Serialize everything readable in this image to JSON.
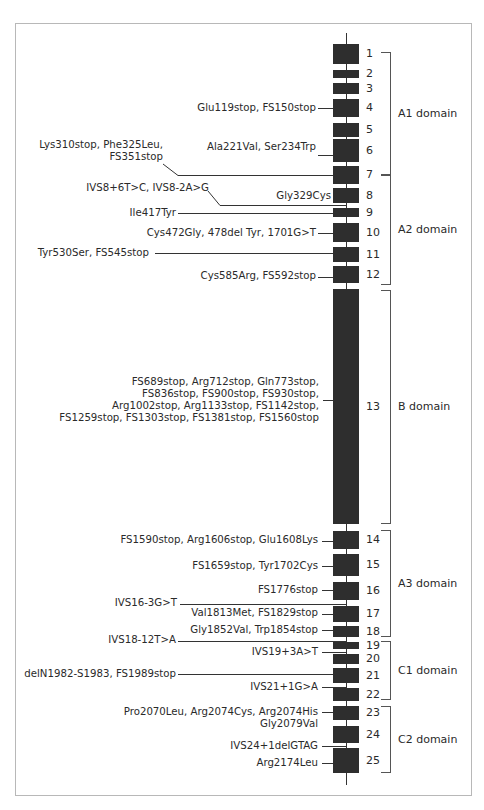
{
  "figure": {
    "title": "",
    "axis_line": {
      "x": 346,
      "y_start": 33,
      "y_end": 785
    }
  },
  "exons": [
    {
      "n": "1",
      "top": 44,
      "bottom": 64
    },
    {
      "n": "2",
      "top": 70,
      "bottom": 78
    },
    {
      "n": "3",
      "top": 83,
      "bottom": 94
    },
    {
      "n": "4",
      "top": 99,
      "bottom": 117
    },
    {
      "n": "5",
      "top": 123,
      "bottom": 137
    },
    {
      "n": "6",
      "top": 139,
      "bottom": 162
    },
    {
      "n": "7",
      "top": 166,
      "bottom": 184
    },
    {
      "n": "8",
      "top": 188,
      "bottom": 203
    },
    {
      "n": "9",
      "top": 208,
      "bottom": 217
    },
    {
      "n": "10",
      "top": 223,
      "bottom": 242
    },
    {
      "n": "11",
      "top": 247,
      "bottom": 262
    },
    {
      "n": "12",
      "top": 266,
      "bottom": 283
    },
    {
      "n": "13",
      "top": 289,
      "bottom": 524
    },
    {
      "n": "14",
      "top": 531,
      "bottom": 549
    },
    {
      "n": "15",
      "top": 554,
      "bottom": 576
    },
    {
      "n": "16",
      "top": 582,
      "bottom": 600
    },
    {
      "n": "17",
      "top": 606,
      "bottom": 622
    },
    {
      "n": "18",
      "top": 626,
      "bottom": 637
    },
    {
      "n": "19",
      "top": 642,
      "bottom": 649
    },
    {
      "n": "20",
      "top": 654,
      "bottom": 664
    },
    {
      "n": "21",
      "top": 668,
      "bottom": 683
    },
    {
      "n": "22",
      "top": 688,
      "bottom": 701
    },
    {
      "n": "23",
      "top": 706,
      "bottom": 720
    },
    {
      "n": "24",
      "top": 726,
      "bottom": 743
    },
    {
      "n": "25",
      "top": 748,
      "bottom": 773
    }
  ],
  "domains": [
    {
      "name": "A1 domain",
      "top": 52,
      "bottom": 175
    },
    {
      "name": "A2 domain",
      "top": 175,
      "bottom": 285
    },
    {
      "name": "B domain",
      "top": 290,
      "bottom": 524
    },
    {
      "name": "A3 domain",
      "top": 530,
      "bottom": 637
    },
    {
      "name": "C1 domain",
      "top": 641,
      "bottom": 700
    },
    {
      "name": "C2 domain",
      "top": 706,
      "bottom": 773
    }
  ],
  "mutations": [
    {
      "lines": [
        "Glu119stop, FS150stop"
      ],
      "text_right": 316,
      "text_top": 102,
      "line_y": 108,
      "line_x1": 318
    },
    {
      "lines": [
        "Lys310stop, Phe325Leu,",
        "FS351stop"
      ],
      "text_right": 163,
      "text_top": 139,
      "line_y": 175,
      "line_x1": 178,
      "diag_from": [
        163,
        164
      ]
    },
    {
      "lines": [
        "Ala221Val, Ser234Trp"
      ],
      "text_right": 316,
      "text_top": 141,
      "line_y": 155,
      "line_x1": 318
    },
    {
      "lines": [
        "IVS8+6T>C, IVS8-2A>G"
      ],
      "text_right": 209,
      "text_top": 182,
      "line_y": 205,
      "line_x1": 220,
      "diag_from": [
        208,
        191
      ]
    },
    {
      "lines": [
        "Gly329Cys"
      ],
      "text_right": 331,
      "text_top": 190,
      "line_y": null,
      "line_x1": null
    },
    {
      "lines": [
        "Ile417Tyr"
      ],
      "text_right": 176,
      "text_top": 207,
      "line_y": 213,
      "line_x1": 178
    },
    {
      "lines": [
        "Cys472Gly, 478del Tyr, 1701G>T"
      ],
      "text_right": 316,
      "text_top": 227,
      "line_y": 233,
      "line_x1": 318
    },
    {
      "lines": [
        "Tyr530Ser, FS545stop"
      ],
      "text_right": 149,
      "text_top": 247,
      "line_y": 253,
      "line_x1": 155
    },
    {
      "lines": [
        "Cys585Arg, FS592stop"
      ],
      "text_right": 316,
      "text_top": 270,
      "line_y": 277,
      "line_x1": 318
    },
    {
      "lines": [
        "FS689stop, Arg712stop, Gln773stop,",
        "FS836stop, FS900stop, FS930stop,",
        "Arg1002stop, Arg1133stop, FS1142stop,",
        "FS1259stop, FS1303stop, FS1381stop, FS1560stop"
      ],
      "text_right": 319,
      "text_top": 376,
      "line_y": 400,
      "line_x1": 323
    },
    {
      "lines": [
        "FS1590stop, Arg1606stop, Glu1608Lys"
      ],
      "text_right": 318,
      "text_top": 534,
      "line_y": 541,
      "line_x1": 322
    },
    {
      "lines": [
        "FS1659stop, Tyr1702Cys"
      ],
      "text_right": 318,
      "text_top": 560,
      "line_y": 566,
      "line_x1": 322
    },
    {
      "lines": [
        "FS1776stop"
      ],
      "text_right": 318,
      "text_top": 584,
      "line_y": 590,
      "line_x1": 322
    },
    {
      "lines": [
        "IVS16-3G>T"
      ],
      "text_right": 177,
      "text_top": 597,
      "line_y": 604,
      "line_x1": 180
    },
    {
      "lines": [
        "Val1813Met, FS1829stop"
      ],
      "text_right": 318,
      "text_top": 607,
      "line_y": 614,
      "line_x1": 322
    },
    {
      "lines": [
        "Gly1852Val, Trp1854stop"
      ],
      "text_right": 318,
      "text_top": 624,
      "line_y": 630,
      "line_x1": 322
    },
    {
      "lines": [
        "IVS18-12T>A"
      ],
      "text_right": 176,
      "text_top": 634,
      "line_y": 641,
      "line_x1": 178
    },
    {
      "lines": [
        "IVS19+3A>T"
      ],
      "text_right": 318,
      "text_top": 646,
      "line_y": 652,
      "line_x1": 322
    },
    {
      "lines": [
        "delN1982-S1983, FS1989stop"
      ],
      "text_right": 176,
      "text_top": 668,
      "line_y": 674,
      "line_x1": 178
    },
    {
      "lines": [
        "IVS21+1G>A"
      ],
      "text_right": 318,
      "text_top": 681,
      "line_y": 687,
      "line_x1": 322
    },
    {
      "lines": [
        "Pro2070Leu, Arg2074Cys, Arg2074His",
        "Gly2079Val"
      ],
      "text_right": 318,
      "text_top": 706,
      "line_y": 712,
      "line_x1": 322
    },
    {
      "lines": [
        "IVS24+1delGTAG"
      ],
      "text_right": 318,
      "text_top": 740,
      "line_y": 746,
      "line_x1": 322
    },
    {
      "lines": [
        "Arg2174Leu"
      ],
      "text_right": 318,
      "text_top": 757,
      "line_y": 763,
      "line_x1": 322
    }
  ]
}
